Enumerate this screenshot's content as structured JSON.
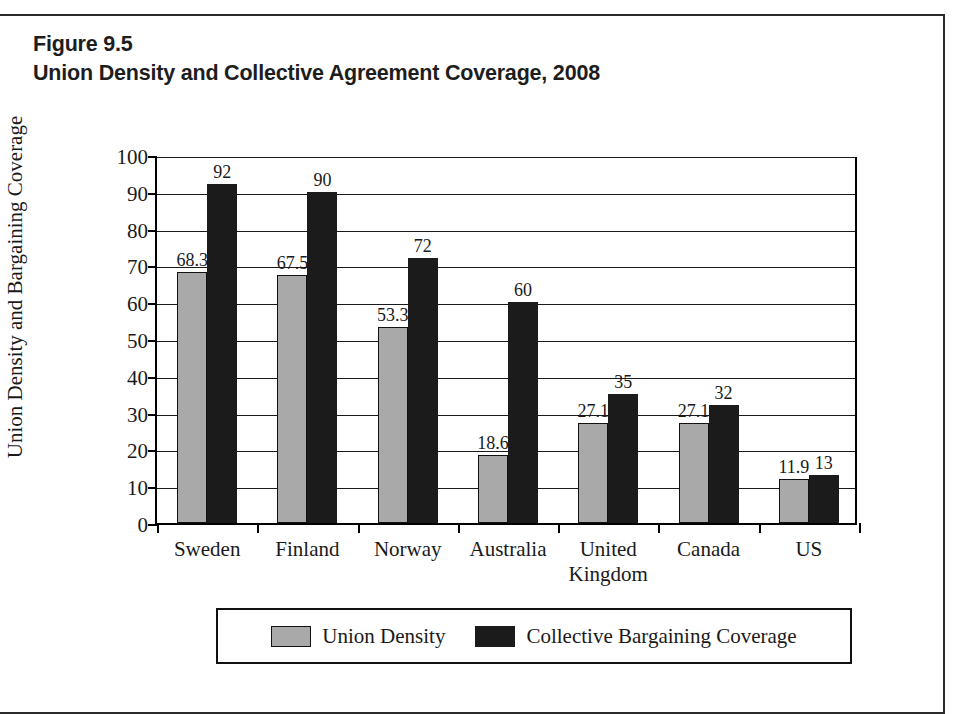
{
  "figure": {
    "label": "Figure 9.5",
    "title": "Union Density and Collective Agreement Coverage, 2008"
  },
  "colors": {
    "union_density": "#a9a9a9",
    "collective_bargaining": "#1b1b1b",
    "axis": "#000000",
    "page_border": "#2b2b2b"
  },
  "chart_data": {
    "type": "bar",
    "title": "Union Density and Collective Agreement Coverage, 2008",
    "xlabel": "",
    "ylabel": "Union Density and Bargaining Coverage",
    "ylim": [
      0,
      100
    ],
    "ytick_step": 10,
    "yticks": [
      0,
      10,
      20,
      30,
      40,
      50,
      60,
      70,
      80,
      90,
      100
    ],
    "grid": true,
    "legend_position": "bottom",
    "categories": [
      "Sweden",
      "Finland",
      "Norway",
      "Australia",
      "United\nKingdom",
      "Canada",
      "US"
    ],
    "series": [
      {
        "name": "Union Density",
        "color": "#a9a9a9",
        "values": [
          68.3,
          67.5,
          53.3,
          18.6,
          27.1,
          27.1,
          11.9
        ],
        "labels": [
          "68.3",
          "67.5",
          "53.3",
          "18.6",
          "27.1",
          "27.1",
          "11.9"
        ]
      },
      {
        "name": "Collective Bargaining Coverage",
        "color": "#1b1b1b",
        "values": [
          92,
          90,
          72,
          60,
          35,
          32,
          13
        ],
        "labels": [
          "92",
          "90",
          "72",
          "60",
          "35",
          "32",
          "13"
        ]
      }
    ]
  },
  "legend": {
    "items": [
      {
        "label": "Union Density",
        "swatch": "union"
      },
      {
        "label": "Collective Bargaining Coverage",
        "swatch": "coverage"
      }
    ]
  }
}
